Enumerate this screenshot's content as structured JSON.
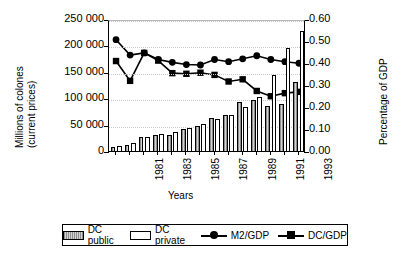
{
  "chart_data": {
    "type": "bar",
    "title": "",
    "xlabel": "Years",
    "ylabel": "Millions of colones (current prices)",
    "ylabel_right": "Percentage of GDP",
    "categories": [
      "1981",
      "1982",
      "1983",
      "1984",
      "1985",
      "1986",
      "1987",
      "1988",
      "1989",
      "1990",
      "1991",
      "1992",
      "1993",
      "1994"
    ],
    "tick_labels_shown": [
      "1981",
      "",
      "1983",
      "",
      "1985",
      "",
      "1987",
      "",
      "1989",
      "",
      "1991",
      "",
      "1993",
      ""
    ],
    "ylim": [
      0,
      250000
    ],
    "yticks": [
      0,
      50000,
      100000,
      150000,
      200000,
      250000
    ],
    "ytick_labels": [
      "0",
      "50 000",
      "100 000",
      "150 000",
      "200 000",
      "250 000"
    ],
    "ylim_right": [
      0,
      0.6
    ],
    "yticks_right": [
      0.0,
      0.1,
      0.2,
      0.3,
      0.4,
      0.5,
      0.6
    ],
    "ytick_labels_right": [
      "0.00",
      "0.10",
      "0.20",
      "0.30",
      "0.40",
      "0.50",
      "0.60"
    ],
    "grid": true,
    "legend_position": "bottom",
    "series": [
      {
        "name": "DC public",
        "type": "bar",
        "axis": "left",
        "fill": "hatched-gray",
        "values": [
          9000,
          13000,
          28000,
          33000,
          33000,
          44000,
          50000,
          64000,
          70000,
          95000,
          98000,
          88000,
          91000,
          133000
        ]
      },
      {
        "name": "DC private",
        "type": "bar",
        "axis": "left",
        "fill": "white",
        "values": [
          12000,
          17000,
          29000,
          34000,
          37000,
          46000,
          53000,
          62000,
          70000,
          85000,
          104000,
          145000,
          197000,
          230000
        ]
      },
      {
        "name": "M2/GDP",
        "type": "line",
        "axis": "right",
        "marker": "circle",
        "values": [
          0.515,
          0.445,
          0.455,
          0.425,
          0.412,
          0.402,
          0.4,
          0.425,
          0.415,
          0.428,
          0.442,
          0.425,
          0.415,
          0.408
        ]
      },
      {
        "name": "DC/GDP",
        "type": "line",
        "axis": "right",
        "marker": "square",
        "values": [
          0.418,
          0.328,
          0.455,
          0.42,
          0.363,
          0.36,
          0.365,
          0.355,
          0.325,
          0.335,
          0.282,
          0.258,
          0.272,
          0.278
        ]
      }
    ]
  },
  "legend": {
    "items": [
      {
        "label": "DC public",
        "marker": "bar-hatched"
      },
      {
        "label": "DC private",
        "marker": "bar-white"
      },
      {
        "label": "M2/GDP",
        "marker": "line-circle"
      },
      {
        "label": "DC/GDP",
        "marker": "line-square"
      }
    ]
  },
  "colors": {
    "axis": "#000000",
    "grid": "#c9c9c9",
    "bar_public": "#9a9a9a",
    "bar_private": "#ffffff",
    "line": "#000000",
    "background": "#ffffff"
  }
}
